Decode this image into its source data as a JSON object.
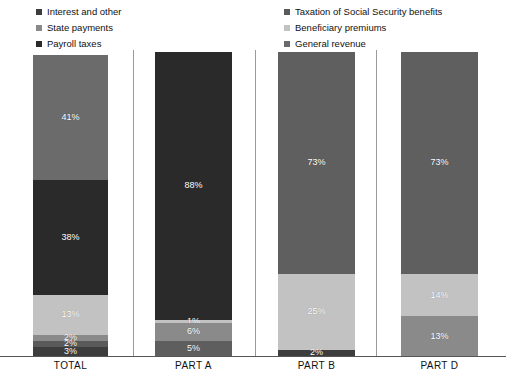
{
  "legend": {
    "left_column": [
      {
        "label": "Interest and other",
        "color": "#3d3d3d"
      },
      {
        "label": "State payments",
        "color": "#8a8a8a"
      },
      {
        "label": "Payroll taxes",
        "color": "#2a2a2a"
      }
    ],
    "right_column": [
      {
        "label": "Taxation of Social Security benefits",
        "color": "#5a5a5a"
      },
      {
        "label": "Beneficiary premiums",
        "color": "#c2c2c2"
      },
      {
        "label": "General revenue",
        "color": "#6b6b6b"
      }
    ]
  },
  "axis": {
    "categories": [
      "TOTAL",
      "PART A",
      "PART B",
      "PART D"
    ]
  },
  "chart_data": {
    "type": "bar",
    "subtype": "stacked-bar-100",
    "title": "",
    "subtitle": "",
    "xlabel": "",
    "ylabel": "",
    "ylim": [
      0,
      100
    ],
    "grid": false,
    "legend_position": "top",
    "categories": [
      "TOTAL",
      "PART A",
      "PART B",
      "PART D"
    ],
    "series": [
      {
        "name": "General revenue",
        "color": "#6b6b6b",
        "values": [
          41,
          0,
          73,
          73
        ]
      },
      {
        "name": "Payroll taxes",
        "color": "#2a2a2a",
        "values": [
          38,
          88,
          0,
          0
        ]
      },
      {
        "name": "Beneficiary premiums",
        "color": "#c2c2c2",
        "values": [
          13,
          1,
          25,
          14
        ]
      },
      {
        "name": "State payments",
        "color": "#8a8a8a",
        "values": [
          2,
          0,
          0,
          13
        ]
      },
      {
        "name": "Taxation of Social Security benefits",
        "color": "#5a5a5a",
        "values": [
          2,
          6,
          0,
          0
        ]
      },
      {
        "name": "Interest and other",
        "color": "#3d3d3d",
        "values": [
          3,
          5,
          2,
          0
        ]
      }
    ],
    "bars": [
      {
        "category": "TOTAL",
        "segments": [
          {
            "series": "General revenue",
            "value": 41,
            "label": "41%",
            "color": "#6b6b6b"
          },
          {
            "series": "Payroll taxes",
            "value": 38,
            "label": "38%",
            "color": "#2a2a2a"
          },
          {
            "series": "Beneficiary premiums",
            "value": 13,
            "label": "13%",
            "color": "#c2c2c2"
          },
          {
            "series": "State payments",
            "value": 2,
            "label": "2%",
            "color": "#8a8a8a"
          },
          {
            "series": "Taxation of Social Security benefits",
            "value": 2,
            "label": "2%",
            "color": "#5a5a5a"
          },
          {
            "series": "Interest and other",
            "value": 3,
            "label": "3%",
            "color": "#3d3d3d"
          }
        ]
      },
      {
        "category": "PART A",
        "segments": [
          {
            "series": "Payroll taxes",
            "value": 88,
            "label": "88%",
            "color": "#2a2a2a"
          },
          {
            "series": "Beneficiary premiums",
            "value": 1,
            "label": "1%",
            "color": "#c2c2c2"
          },
          {
            "series": "Taxation of Social Security benefits",
            "value": 6,
            "label": "6%",
            "color": "#8a8a8a"
          },
          {
            "series": "Interest and other",
            "value": 5,
            "label": "5%",
            "color": "#5e5e5e"
          }
        ]
      },
      {
        "category": "PART B",
        "segments": [
          {
            "series": "General revenue",
            "value": 73,
            "label": "73%",
            "color": "#5f5f5f"
          },
          {
            "series": "Beneficiary premiums",
            "value": 25,
            "label": "25%",
            "color": "#c2c2c2"
          },
          {
            "series": "Interest and other",
            "value": 2,
            "label": "2%",
            "color": "#3d3d3d"
          }
        ]
      },
      {
        "category": "PART D",
        "segments": [
          {
            "series": "General revenue",
            "value": 73,
            "label": "73%",
            "color": "#5f5f5f"
          },
          {
            "series": "Beneficiary premiums",
            "value": 14,
            "label": "14%",
            "color": "#c2c2c2"
          },
          {
            "series": "State payments",
            "value": 13,
            "label": "13%",
            "color": "#8a8a8a"
          }
        ]
      }
    ]
  }
}
